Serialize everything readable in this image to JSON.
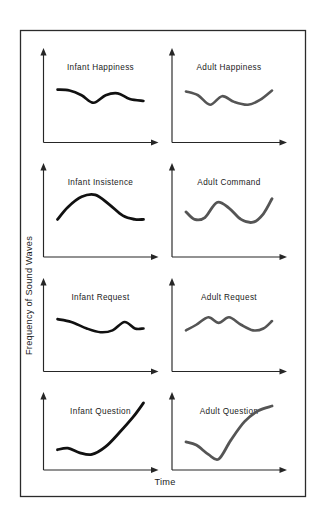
{
  "figure": {
    "background_color": "#ffffff",
    "frame_color": "#2b2b2b",
    "axis_color": "#262626",
    "infant_curve_color": "#111111",
    "adult_curve_color": "#555555",
    "y_axis_label": "Frequency of Sound Waves",
    "x_axis_label": "Time"
  },
  "chart_data": {
    "type": "line",
    "title": "",
    "xlabel": "Time",
    "ylabel": "Frequency of Sound Waves",
    "grid": false,
    "legend": "none",
    "axis_ticks": "none",
    "layout": {
      "rows": 4,
      "cols": 2,
      "column_groups": [
        "Infant",
        "Adult"
      ]
    },
    "panels": [
      {
        "id": "infant-happiness",
        "title": "Infant Happiness",
        "row": 1,
        "col": 1,
        "group": "Infant",
        "color": "#111111",
        "stroke_width": 2.6,
        "description": "Gently undulating, slightly falling contour",
        "x": [
          0.0,
          0.14,
          0.28,
          0.42,
          0.56,
          0.7,
          0.84,
          1.0
        ],
        "y": [
          0.56,
          0.55,
          0.5,
          0.42,
          0.5,
          0.52,
          0.46,
          0.44
        ]
      },
      {
        "id": "adult-happiness",
        "title": "Adult Happiness",
        "row": 1,
        "col": 2,
        "group": "Adult",
        "color": "#555555",
        "stroke_width": 2.6,
        "description": "Shallow dip, small rise, dip, then gentle rise",
        "x": [
          0.0,
          0.14,
          0.28,
          0.42,
          0.56,
          0.72,
          0.86,
          1.0
        ],
        "y": [
          0.54,
          0.5,
          0.4,
          0.49,
          0.43,
          0.4,
          0.45,
          0.55
        ]
      },
      {
        "id": "infant-insistence",
        "title": "Infant Insistence",
        "row": 2,
        "col": 1,
        "group": "Infant",
        "color": "#111111",
        "stroke_width": 2.8,
        "description": "Broad arch rising to a hump then falling to a flat tail",
        "x": [
          0.0,
          0.12,
          0.28,
          0.44,
          0.6,
          0.76,
          0.9,
          1.0
        ],
        "y": [
          0.4,
          0.53,
          0.64,
          0.66,
          0.56,
          0.44,
          0.4,
          0.4
        ]
      },
      {
        "id": "adult-command",
        "title": "Adult Command",
        "row": 2,
        "col": 2,
        "group": "Adult",
        "color": "#555555",
        "stroke_width": 2.8,
        "description": "Wave: dip, hump, long dip, rising tail",
        "x": [
          0.0,
          0.1,
          0.22,
          0.36,
          0.5,
          0.64,
          0.78,
          0.9,
          1.0
        ],
        "y": [
          0.48,
          0.4,
          0.42,
          0.58,
          0.52,
          0.4,
          0.37,
          0.46,
          0.62
        ]
      },
      {
        "id": "infant-request",
        "title": "Infant Request",
        "row": 3,
        "col": 1,
        "group": "Infant",
        "color": "#111111",
        "stroke_width": 2.6,
        "description": "Slow decline then a small late bump",
        "x": [
          0.0,
          0.16,
          0.34,
          0.5,
          0.64,
          0.78,
          0.9,
          1.0
        ],
        "y": [
          0.56,
          0.53,
          0.46,
          0.42,
          0.44,
          0.53,
          0.46,
          0.46
        ]
      },
      {
        "id": "adult-request",
        "title": "Adult Request",
        "row": 3,
        "col": 2,
        "group": "Adult",
        "color": "#555555",
        "stroke_width": 2.6,
        "description": "Two rounded humps then a low flat stretch and slight rise",
        "x": [
          0.0,
          0.12,
          0.26,
          0.38,
          0.5,
          0.64,
          0.78,
          0.9,
          1.0
        ],
        "y": [
          0.44,
          0.5,
          0.58,
          0.52,
          0.58,
          0.5,
          0.44,
          0.46,
          0.54
        ]
      },
      {
        "id": "infant-question",
        "title": "Infant Question",
        "row": 4,
        "col": 1,
        "group": "Infant",
        "color": "#111111",
        "stroke_width": 2.8,
        "description": "Flat low start, slight sag, then steep sustained rise",
        "x": [
          0.0,
          0.12,
          0.26,
          0.4,
          0.56,
          0.72,
          0.88,
          1.0
        ],
        "y": [
          0.26,
          0.28,
          0.22,
          0.2,
          0.3,
          0.48,
          0.68,
          0.86
        ]
      },
      {
        "id": "adult-question",
        "title": "Adult Question",
        "row": 4,
        "col": 2,
        "group": "Adult",
        "color": "#555555",
        "stroke_width": 2.8,
        "description": "Falls to a trough then rises steeply and levels off high",
        "x": [
          0.0,
          0.12,
          0.26,
          0.38,
          0.52,
          0.68,
          0.84,
          1.0
        ],
        "y": [
          0.36,
          0.32,
          0.2,
          0.14,
          0.38,
          0.62,
          0.76,
          0.82
        ]
      }
    ]
  }
}
